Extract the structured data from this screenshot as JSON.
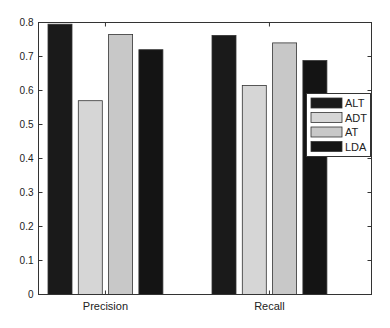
{
  "chart_data": {
    "type": "bar",
    "title": "",
    "xlabel": "",
    "ylabel": "",
    "categories": [
      "Precision",
      "Recall"
    ],
    "series": [
      {
        "name": "ALT",
        "color": "#1a1a1a",
        "values": [
          0.795,
          0.762
        ]
      },
      {
        "name": "ADT",
        "color": "#d6d6d6",
        "values": [
          0.57,
          0.615
        ]
      },
      {
        "name": "AT",
        "color": "#c8c8c8",
        "values": [
          0.765,
          0.74
        ]
      },
      {
        "name": "LDA",
        "color": "#141414",
        "values": [
          0.72,
          0.688
        ]
      }
    ],
    "ylim": [
      0,
      0.8
    ],
    "yticks": [
      "0",
      "0.1",
      "0.2",
      "0.3",
      "0.4",
      "0.5",
      "0.6",
      "0.7",
      "0.8"
    ],
    "grid": false,
    "legend_position": "right-inside"
  }
}
